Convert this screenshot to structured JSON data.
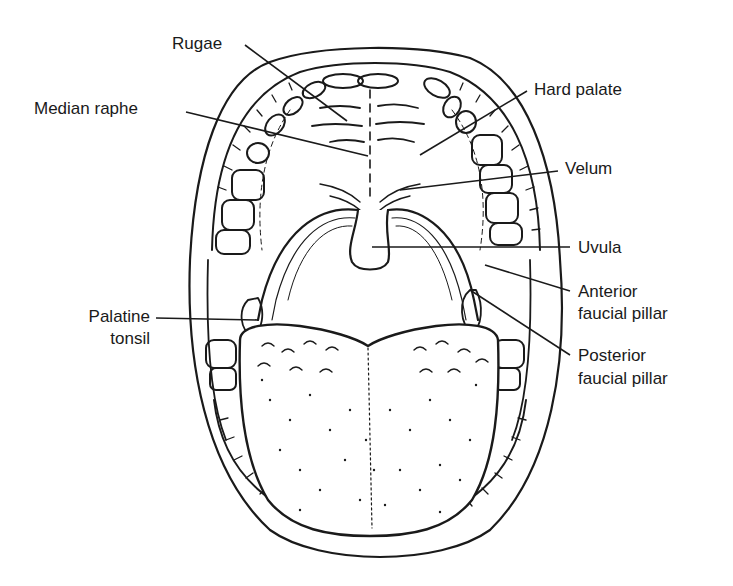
{
  "diagram": {
    "labels": {
      "rugae": "Rugae",
      "median_raphe": "Median raphe",
      "hard_palate": "Hard palate",
      "velum": "Velum",
      "uvula": "Uvula",
      "anterior_pillar_1": "Anterior",
      "anterior_pillar_2": "faucial pillar",
      "posterior_pillar_1": "Posterior",
      "posterior_pillar_2": "faucial pillar",
      "palatine_tonsil_1": "Palatine",
      "palatine_tonsil_2": "tonsil"
    },
    "colors": {
      "ink": "#1a1a1a",
      "background": "#ffffff"
    }
  }
}
